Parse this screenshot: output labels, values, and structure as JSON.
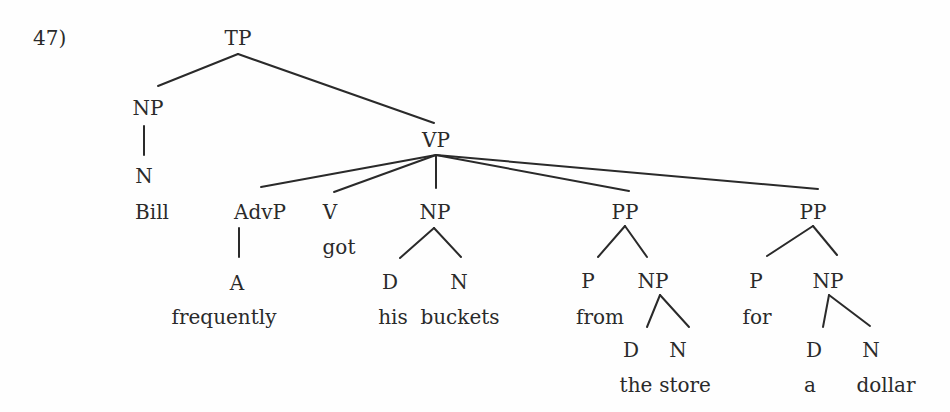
{
  "example_number": "47)",
  "tree": {
    "nodes": [
      {
        "id": "tp",
        "label": "TP",
        "x": 238,
        "y": 38
      },
      {
        "id": "np1",
        "label": "NP",
        "x": 148,
        "y": 108
      },
      {
        "id": "n1",
        "label": "N",
        "x": 144,
        "y": 176
      },
      {
        "id": "bill",
        "label": "Bill",
        "x": 152,
        "y": 212,
        "terminal": true
      },
      {
        "id": "vp",
        "label": "VP",
        "x": 436,
        "y": 140
      },
      {
        "id": "advp",
        "label": "AdvP",
        "x": 260,
        "y": 212
      },
      {
        "id": "a",
        "label": "A",
        "x": 237,
        "y": 283
      },
      {
        "id": "frequently",
        "label": "frequently",
        "x": 224,
        "y": 317,
        "terminal": true
      },
      {
        "id": "v",
        "label": "V",
        "x": 330,
        "y": 212
      },
      {
        "id": "got",
        "label": "got",
        "x": 339,
        "y": 247,
        "terminal": true
      },
      {
        "id": "np2",
        "label": "NP",
        "x": 435,
        "y": 212
      },
      {
        "id": "d1",
        "label": "D",
        "x": 390,
        "y": 282
      },
      {
        "id": "n2",
        "label": "N",
        "x": 459,
        "y": 282
      },
      {
        "id": "his",
        "label": "his",
        "x": 393,
        "y": 317,
        "terminal": true
      },
      {
        "id": "buckets",
        "label": "buckets",
        "x": 460,
        "y": 317,
        "terminal": true
      },
      {
        "id": "pp1",
        "label": "PP",
        "x": 625,
        "y": 212
      },
      {
        "id": "p1",
        "label": "P",
        "x": 588,
        "y": 281
      },
      {
        "id": "from",
        "label": "from",
        "x": 600,
        "y": 317,
        "terminal": true
      },
      {
        "id": "np3",
        "label": "NP",
        "x": 653,
        "y": 281
      },
      {
        "id": "d2",
        "label": "D",
        "x": 631,
        "y": 350
      },
      {
        "id": "the",
        "label": "the",
        "x": 636,
        "y": 385,
        "terminal": true
      },
      {
        "id": "n3",
        "label": "N",
        "x": 678,
        "y": 350
      },
      {
        "id": "store",
        "label": "store",
        "x": 685,
        "y": 385,
        "terminal": true
      },
      {
        "id": "pp2",
        "label": "PP",
        "x": 813,
        "y": 212
      },
      {
        "id": "p2",
        "label": "P",
        "x": 756,
        "y": 281
      },
      {
        "id": "for",
        "label": "for",
        "x": 757,
        "y": 317,
        "terminal": true
      },
      {
        "id": "np4",
        "label": "NP",
        "x": 828,
        "y": 281
      },
      {
        "id": "d3",
        "label": "D",
        "x": 814,
        "y": 350
      },
      {
        "id": "a_det",
        "label": "a",
        "x": 810,
        "y": 385,
        "terminal": true
      },
      {
        "id": "n4",
        "label": "N",
        "x": 871,
        "y": 350
      },
      {
        "id": "dollar",
        "label": "dollar",
        "x": 886,
        "y": 385,
        "terminal": true
      }
    ],
    "edges": [
      {
        "from": "tp",
        "to": "np1",
        "x1": 238,
        "y1": 54,
        "x2": 158,
        "y2": 86
      },
      {
        "from": "tp",
        "to": "vp",
        "x1": 238,
        "y1": 54,
        "x2": 434,
        "y2": 123
      },
      {
        "from": "np1",
        "to": "n1",
        "x1": 144,
        "y1": 126,
        "x2": 144,
        "y2": 155
      },
      {
        "from": "vp",
        "to": "advp",
        "x1": 436,
        "y1": 155,
        "x2": 261,
        "y2": 187
      },
      {
        "from": "vp",
        "to": "v",
        "x1": 436,
        "y1": 155,
        "x2": 334,
        "y2": 192
      },
      {
        "from": "vp",
        "to": "np2",
        "x1": 436,
        "y1": 155,
        "x2": 436,
        "y2": 188
      },
      {
        "from": "vp",
        "to": "pp1",
        "x1": 436,
        "y1": 155,
        "x2": 629,
        "y2": 191
      },
      {
        "from": "vp",
        "to": "pp2",
        "x1": 436,
        "y1": 155,
        "x2": 818,
        "y2": 189
      },
      {
        "from": "advp",
        "to": "a",
        "x1": 239,
        "y1": 228,
        "x2": 239,
        "y2": 257
      },
      {
        "from": "np2",
        "to": "d1",
        "x1": 434,
        "y1": 228,
        "x2": 400,
        "y2": 258
      },
      {
        "from": "np2",
        "to": "n2",
        "x1": 434,
        "y1": 228,
        "x2": 461,
        "y2": 257
      },
      {
        "from": "pp1",
        "to": "p1",
        "x1": 625,
        "y1": 226,
        "x2": 598,
        "y2": 257
      },
      {
        "from": "pp1",
        "to": "np3",
        "x1": 625,
        "y1": 226,
        "x2": 647,
        "y2": 257
      },
      {
        "from": "np3",
        "to": "d2",
        "x1": 660,
        "y1": 295,
        "x2": 647,
        "y2": 327
      },
      {
        "from": "np3",
        "to": "n3",
        "x1": 660,
        "y1": 295,
        "x2": 689,
        "y2": 327
      },
      {
        "from": "pp2",
        "to": "p2",
        "x1": 813,
        "y1": 226,
        "x2": 767,
        "y2": 256
      },
      {
        "from": "pp2",
        "to": "np4",
        "x1": 813,
        "y1": 226,
        "x2": 837,
        "y2": 255
      },
      {
        "from": "np4",
        "to": "d3",
        "x1": 829,
        "y1": 295,
        "x2": 823,
        "y2": 327
      },
      {
        "from": "np4",
        "to": "n4",
        "x1": 829,
        "y1": 295,
        "x2": 870,
        "y2": 326
      }
    ]
  },
  "colors": {
    "ink": "#2a2a2a",
    "background": "#fefefe"
  }
}
